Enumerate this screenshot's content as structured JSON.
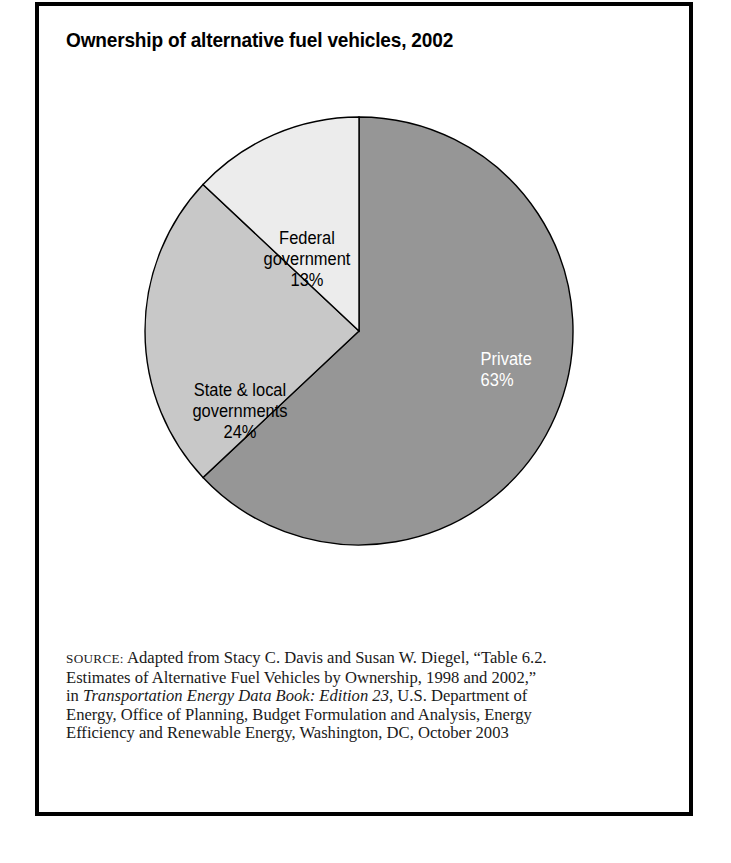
{
  "figure": {
    "title": "Ownership of alternative fuel vehicles, 2002"
  },
  "chart_data": {
    "type": "pie",
    "title": "Ownership of alternative fuel vehicles, 2002",
    "xlabel": "",
    "ylabel": "",
    "categories": [
      "Private",
      "State & local governments",
      "Federal government"
    ],
    "values": [
      63,
      24,
      13
    ],
    "value_unit": "%",
    "value_labels": [
      "63%",
      "24%",
      "13%"
    ],
    "colors": [
      "#969696",
      "#c8c8c8",
      "#ececec"
    ],
    "label_colors": [
      "#ffffff",
      "#000000",
      "#000000"
    ],
    "start_angle_deg": 0,
    "direction": "clockwise",
    "legend": "none",
    "grid": false,
    "slices": [
      {
        "name": "Private",
        "name_line1": "Private",
        "value": 63,
        "value_label": "63%",
        "color": "#969696",
        "label_color": "#ffffff"
      },
      {
        "name": "State & local governments",
        "name_line1": "State & local",
        "name_line2": "governments",
        "value": 24,
        "value_label": "24%",
        "color": "#c8c8c8",
        "label_color": "#000000"
      },
      {
        "name": "Federal government",
        "name_line1": "Federal",
        "name_line2": "government",
        "value": 13,
        "value_label": "13%",
        "color": "#ececec",
        "label_color": "#000000"
      }
    ]
  },
  "source": {
    "label": "SOURCE:",
    "line1_rest": " Adapted from Stacy C. Davis and Susan W. Diegel, “Table 6.2.",
    "line2": "Estimates of Alternative Fuel Vehicles by Ownership, 1998 and 2002,”",
    "line3_pre": "in ",
    "line3_italic": "Transportation Energy Data Book: Edition 23",
    "line3_post": ", U.S. Department of",
    "line4": "Energy, Office of Planning, Budget Formulation and Analysis, Energy",
    "line5": "Efficiency and Renewable Energy, Washington, DC, October 2003"
  }
}
